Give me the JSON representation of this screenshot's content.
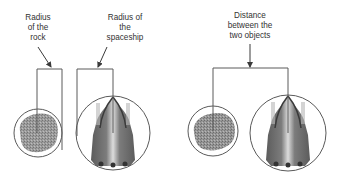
{
  "diagram": {
    "colors": {
      "line": "#5a5a5a",
      "text": "#333333",
      "rock": "#6e6e6e",
      "ship": "#7a7a7a",
      "background": "#ffffff"
    },
    "left_panel": {
      "rock_label": [
        "Radius",
        "of the",
        "rock"
      ],
      "ship_label": [
        "Radius of",
        "the",
        "spaceship"
      ],
      "objects": [
        {
          "name": "rock",
          "cx": 38,
          "cy": 133,
          "r": 24
        },
        {
          "name": "spaceship",
          "cx": 113,
          "cy": 133,
          "r": 37
        }
      ]
    },
    "right_panel": {
      "distance_label": [
        "Distance",
        "between the",
        "two objects"
      ],
      "objects": [
        {
          "name": "rock",
          "cx": 213,
          "cy": 131,
          "r": 25
        },
        {
          "name": "spaceship",
          "cx": 288,
          "cy": 133,
          "r": 38
        }
      ]
    }
  }
}
